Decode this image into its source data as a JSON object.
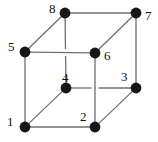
{
  "figure": {
    "name": "labeled-cube-diagram",
    "background_color": "#ffffff",
    "edge_color": "#6f6f6f",
    "vertex_color": "#161616",
    "label_color": "#111111",
    "width": 158,
    "height": 142
  },
  "chart_data": {
    "type": "diagram",
    "subtype": "cube-vertex-graph",
    "title": "",
    "vertices": [
      {
        "id": "1",
        "label": "1",
        "x": 25,
        "y": 127,
        "face": "front-bottom-left",
        "label_x": 7,
        "label_y": 115
      },
      {
        "id": "2",
        "label": "2",
        "x": 95,
        "y": 127,
        "face": "front-bottom-right",
        "label_x": 80,
        "label_y": 110
      },
      {
        "id": "3",
        "label": "3",
        "x": 136,
        "y": 88,
        "face": "back-bottom-right",
        "label_x": 121,
        "label_y": 70
      },
      {
        "id": "4",
        "label": "4",
        "x": 66,
        "y": 88,
        "face": "back-bottom-left",
        "label_x": 62,
        "label_y": 71
      },
      {
        "id": "5",
        "label": "5",
        "x": 25,
        "y": 52,
        "face": "front-top-left",
        "label_x": 8,
        "label_y": 40
      },
      {
        "id": "6",
        "label": "6",
        "x": 95,
        "y": 53,
        "face": "front-top-right",
        "label_x": 104,
        "label_y": 49
      },
      {
        "id": "7",
        "label": "7",
        "x": 136,
        "y": 13,
        "face": "back-top-right",
        "label_x": 145,
        "label_y": 9
      },
      {
        "id": "8",
        "label": "8",
        "x": 65,
        "y": 13,
        "face": "back-top-left",
        "label_x": 49,
        "label_y": 2
      }
    ],
    "edges": [
      {
        "from": "1",
        "to": "2",
        "kind": "solid"
      },
      {
        "from": "1",
        "to": "5",
        "kind": "solid"
      },
      {
        "from": "1",
        "to": "4",
        "kind": "solid"
      },
      {
        "from": "2",
        "to": "3",
        "kind": "solid"
      },
      {
        "from": "2",
        "to": "6",
        "kind": "solid"
      },
      {
        "from": "3",
        "to": "7",
        "kind": "solid"
      },
      {
        "from": "3",
        "to": "4",
        "kind": "occluded"
      },
      {
        "from": "4",
        "to": "8",
        "kind": "occluded"
      },
      {
        "from": "5",
        "to": "6",
        "kind": "solid"
      },
      {
        "from": "5",
        "to": "8",
        "kind": "solid"
      },
      {
        "from": "6",
        "to": "7",
        "kind": "solid"
      },
      {
        "from": "7",
        "to": "8",
        "kind": "solid"
      }
    ],
    "vertex_radius": 5.4,
    "edge_width": 1.3
  }
}
